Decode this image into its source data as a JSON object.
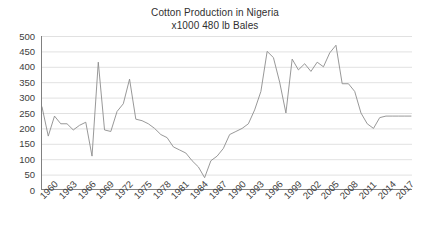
{
  "chart_data": {
    "type": "line",
    "title": "Cotton Production in Nigeria",
    "subtitle": "x1000 480 lb Bales",
    "xlabel": "",
    "ylabel": "",
    "ylim": [
      0,
      500
    ],
    "ytick_step": 50,
    "yticks": [
      "0",
      "50",
      "100",
      "150",
      "200",
      "250",
      "300",
      "350",
      "400",
      "450",
      "500"
    ],
    "grid": true,
    "grid_axis": "y",
    "legend": "none",
    "line_color": "#8c8c8c",
    "axis_color": "#808080",
    "grid_color": "#d9d9d9",
    "text_color": "#3d3d3d",
    "x_tick_interval": 3,
    "xticks": [
      "1960",
      "1963",
      "1966",
      "1969",
      "1972",
      "1975",
      "1978",
      "1981",
      "1984",
      "1987",
      "1990",
      "1993",
      "1996",
      "1999",
      "2002",
      "2005",
      "2008",
      "2011",
      "2014",
      "2017"
    ],
    "x": [
      1960,
      1961,
      1962,
      1963,
      1964,
      1965,
      1966,
      1967,
      1968,
      1969,
      1970,
      1971,
      1972,
      1973,
      1974,
      1975,
      1976,
      1977,
      1978,
      1979,
      1980,
      1981,
      1982,
      1983,
      1984,
      1985,
      1986,
      1987,
      1988,
      1989,
      1990,
      1991,
      1992,
      1993,
      1994,
      1995,
      1996,
      1997,
      1998,
      1999,
      2000,
      2001,
      2002,
      2003,
      2004,
      2005,
      2006,
      2007,
      2008,
      2009,
      2010,
      2011,
      2012,
      2013,
      2014,
      2015,
      2016,
      2017,
      2018,
      2019
    ],
    "values": [
      270,
      175,
      240,
      215,
      215,
      195,
      210,
      220,
      110,
      415,
      195,
      190,
      255,
      280,
      360,
      230,
      225,
      215,
      200,
      180,
      170,
      140,
      130,
      120,
      95,
      75,
      40,
      95,
      110,
      135,
      180,
      190,
      200,
      215,
      260,
      320,
      450,
      430,
      350,
      250,
      425,
      390,
      410,
      385,
      415,
      400,
      445,
      470,
      345,
      345,
      320,
      250,
      215,
      200,
      235,
      240,
      240,
      240,
      240,
      240
    ]
  }
}
